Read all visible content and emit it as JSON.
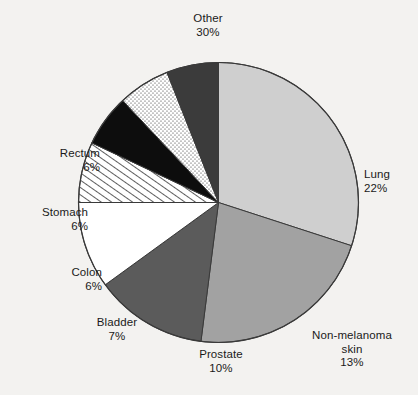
{
  "background_color": "#f3f2f0",
  "chart_data": {
    "type": "pie",
    "title": "",
    "subtitle": "",
    "xlabel": "",
    "ylabel": "",
    "legend_position": "none",
    "grid": false,
    "units": "percent",
    "start_angle_deg": 0,
    "direction": "clockwise",
    "categories": [
      "Other",
      "Lung",
      "Non-melanoma skin",
      "Prostate",
      "Bladder",
      "Colon",
      "Stomach",
      "Rectum"
    ],
    "values": [
      30,
      22,
      13,
      10,
      7,
      6,
      6,
      6
    ],
    "slices": [
      {
        "label": "Other",
        "label_line1": "Other",
        "label_line2": "",
        "percent_text": "30%",
        "value": 30,
        "fill": "#cfcfcf",
        "pattern": "solid"
      },
      {
        "label": "Lung",
        "label_line1": "Lung",
        "label_line2": "",
        "percent_text": "22%",
        "value": 22,
        "fill": "#a2a2a2",
        "pattern": "solid"
      },
      {
        "label": "Non-melanoma skin",
        "label_line1": "Non-melanoma",
        "label_line2": "skin",
        "percent_text": "13%",
        "value": 13,
        "fill": "#5b5b5b",
        "pattern": "solid"
      },
      {
        "label": "Prostate",
        "label_line1": "Prostate",
        "label_line2": "",
        "percent_text": "10%",
        "value": 10,
        "fill": "#ffffff",
        "pattern": "solid"
      },
      {
        "label": "Bladder",
        "label_line1": "Bladder",
        "label_line2": "",
        "percent_text": "7%",
        "value": 7,
        "fill": "#ffffff",
        "pattern": "diagonal-hatch"
      },
      {
        "label": "Colon",
        "label_line1": "Colon",
        "label_line2": "",
        "percent_text": "6%",
        "value": 6,
        "fill": "#0d0d0d",
        "pattern": "solid"
      },
      {
        "label": "Stomach",
        "label_line1": "Stomach",
        "label_line2": "",
        "percent_text": "6%",
        "value": 6,
        "fill": "#ffffff",
        "pattern": "stipple-dots"
      },
      {
        "label": "Rectum",
        "label_line1": "Rectum",
        "label_line2": "",
        "percent_text": "6%",
        "value": 6,
        "fill": "#3b3b3b",
        "pattern": "solid"
      }
    ]
  },
  "labels": {
    "other": {
      "name": "Other",
      "percent": "30%"
    },
    "lung": {
      "name": "Lung",
      "percent": "22%"
    },
    "nonmel": {
      "name": "Non-melanoma",
      "name2": "skin",
      "percent": "13%"
    },
    "prostate": {
      "name": "Prostate",
      "percent": "10%"
    },
    "bladder": {
      "name": "Bladder",
      "percent": "7%"
    },
    "colon": {
      "name": "Colon",
      "percent": "6%"
    },
    "stomach": {
      "name": "Stomach",
      "percent": "6%"
    },
    "rectum": {
      "name": "Rectum",
      "percent": "6%"
    }
  }
}
